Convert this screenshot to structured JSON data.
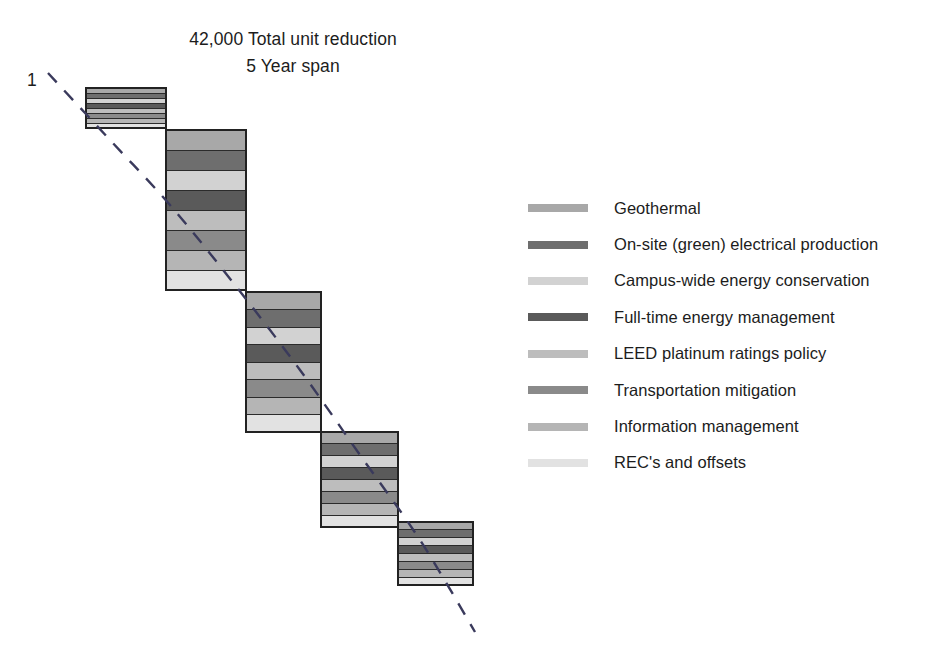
{
  "title": {
    "line1": "42,000 Total unit reduction",
    "line2": "5 Year span"
  },
  "axis": {
    "y_label": "1"
  },
  "legend": {
    "items": [
      {
        "label": "Geothermal",
        "color": "#a8a8a8"
      },
      {
        "label": "On-site (green) electrical production",
        "color": "#6e6e6e"
      },
      {
        "label": "Campus-wide energy conservation",
        "color": "#d2d2d2"
      },
      {
        "label": "Full-time energy management",
        "color": "#5a5a5a"
      },
      {
        "label": "LEED platinum ratings policy",
        "color": "#bdbdbd"
      },
      {
        "label": "Transportation mitigation",
        "color": "#8a8a8a"
      },
      {
        "label": "Information management",
        "color": "#b5b5b5"
      },
      {
        "label": "REC's and offsets",
        "color": "#e2e2e2"
      }
    ]
  },
  "chart_data": {
    "type": "bar",
    "subtitle": "5 Year span",
    "xlabel": "",
    "ylabel": "1",
    "grid": false,
    "legend_position": "right",
    "orientation": "vertical-stacked-descending-wedge",
    "categories": [
      "Year 1",
      "Year 2",
      "Year 3",
      "Year 4",
      "Year 5"
    ],
    "series": [
      {
        "name": "Geothermal",
        "color": "#a8a8a8",
        "values": [
          5,
          20,
          17.5,
          12,
          8
        ]
      },
      {
        "name": "On-site (green) electrical production",
        "color": "#6e6e6e",
        "values": [
          5,
          20,
          17.5,
          12,
          8
        ]
      },
      {
        "name": "Campus-wide energy conservation",
        "color": "#d2d2d2",
        "values": [
          5,
          20,
          17.5,
          12,
          8
        ]
      },
      {
        "name": "Full-time energy management",
        "color": "#5a5a5a",
        "values": [
          5,
          20,
          17.5,
          12,
          8
        ]
      },
      {
        "name": "LEED platinum ratings policy",
        "color": "#bdbdbd",
        "values": [
          5,
          20,
          17.5,
          12,
          8
        ]
      },
      {
        "name": "Transportation mitigation",
        "color": "#8a8a8a",
        "values": [
          5,
          20,
          17.5,
          12,
          8
        ]
      },
      {
        "name": "Information management",
        "color": "#b5b5b5",
        "values": [
          5,
          20,
          17.5,
          12,
          8
        ]
      },
      {
        "name": "REC's and offsets",
        "color": "#e2e2e2",
        "values": [
          5,
          20,
          17.5,
          12,
          8
        ]
      }
    ],
    "bar_totals": [
      40,
      160,
      140,
      95,
      63
    ],
    "bars_geometry": [
      {
        "x": 86,
        "y": 88,
        "width": 80,
        "height": 40
      },
      {
        "x": 166,
        "y": 130,
        "width": 80,
        "height": 160
      },
      {
        "x": 246,
        "y": 292,
        "width": 75,
        "height": 140
      },
      {
        "x": 321,
        "y": 432,
        "width": 77,
        "height": 95
      },
      {
        "x": 398,
        "y": 522,
        "width": 75,
        "height": 63
      }
    ],
    "reference_curve": {
      "style": "dashed",
      "color": "#3a3a5c",
      "points": [
        [
          48,
          73
        ],
        [
          110,
          140
        ],
        [
          170,
          205
        ],
        [
          235,
          285
        ],
        [
          300,
          370
        ],
        [
          360,
          455
        ],
        [
          420,
          540
        ],
        [
          475,
          632
        ]
      ]
    },
    "annotations": [
      {
        "text": "42,000 Total unit reduction",
        "position": "top-center"
      },
      {
        "text": "5 Year span",
        "position": "top-center"
      },
      {
        "text": "1",
        "position": "left-axis"
      }
    ]
  }
}
